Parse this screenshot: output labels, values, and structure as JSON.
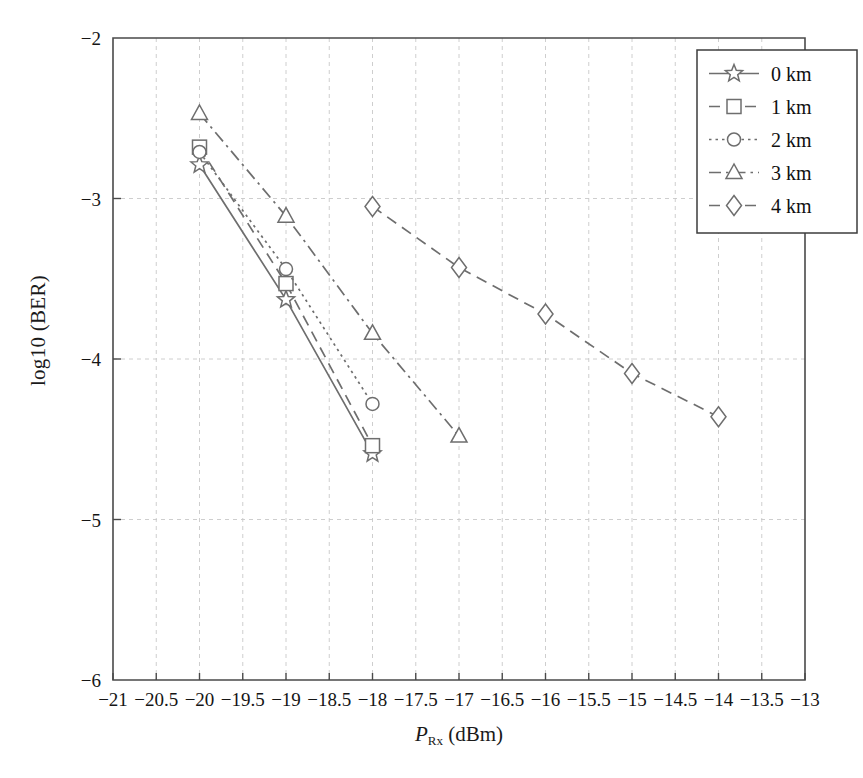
{
  "chart_data": {
    "type": "line",
    "title": "",
    "xlabel": "P_Rx (dBm)",
    "xlabel_parts": {
      "symbol": "P",
      "subscript": "Rx",
      "unit": "(dBm)"
    },
    "ylabel": "log10 (BER)",
    "xlim": [
      -21,
      -13
    ],
    "ylim": [
      -6,
      -2
    ],
    "xticks": [
      -21,
      -20.5,
      -20,
      -19.5,
      -19,
      -18.5,
      -18,
      -17.5,
      -17,
      -16.5,
      -16,
      -15.5,
      -15,
      -14.5,
      -14,
      -13.5,
      -13
    ],
    "xtick_labels": [
      "−21",
      "−20.5",
      "−20",
      "−19.5",
      "−19",
      "−18.5",
      "−18",
      "−17.5",
      "−17",
      "−16.5",
      "−16",
      "−15.5",
      "−15",
      "−14.5",
      "−14",
      "−13.5",
      "−13"
    ],
    "yticks": [
      -2,
      -3,
      -4,
      -5,
      -6
    ],
    "ytick_labels": [
      "−2",
      "−3",
      "−4",
      "−5",
      "−6"
    ],
    "grid": true,
    "grid_color": "#c8c8c8",
    "line_color": "#6e6e6e",
    "legend_position": "top-right",
    "series": [
      {
        "name": "0 km",
        "marker": "star",
        "dash": "solid",
        "x": [
          -20,
          -19,
          -18
        ],
        "y": [
          -2.79,
          -3.63,
          -4.59
        ]
      },
      {
        "name": "1 km",
        "marker": "square",
        "dash": "dashed",
        "x": [
          -20,
          -19,
          -18
        ],
        "y": [
          -2.68,
          -3.53,
          -4.54
        ]
      },
      {
        "name": "2 km",
        "marker": "circle",
        "dash": "dotted",
        "x": [
          -20,
          -19,
          -18
        ],
        "y": [
          -2.71,
          -3.44,
          -4.28
        ]
      },
      {
        "name": "3 km",
        "marker": "triangle",
        "dash": "dashdot",
        "x": [
          -20,
          -19,
          -18,
          -17
        ],
        "y": [
          -2.47,
          -3.11,
          -3.84,
          -4.48
        ]
      },
      {
        "name": "4 km",
        "marker": "diamond",
        "dash": "dashed",
        "x": [
          -18,
          -17,
          -16,
          -15,
          -14
        ],
        "y": [
          -3.05,
          -3.43,
          -3.72,
          -4.09,
          -4.36
        ]
      }
    ]
  },
  "legend": {
    "items": [
      {
        "label": "0 km"
      },
      {
        "label": "1 km"
      },
      {
        "label": "2 km"
      },
      {
        "label": "3 km"
      },
      {
        "label": "4 km"
      }
    ]
  }
}
